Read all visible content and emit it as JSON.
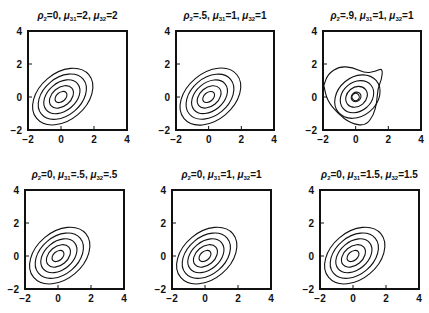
{
  "chart_data": [
    {
      "type": "contour",
      "panel": 1,
      "title": "ρ2=0, μ31=2, μ32=2",
      "params": {
        "rho2": "0",
        "mu31": "2",
        "mu32": "2"
      },
      "xlim": [
        -2,
        4
      ],
      "ylim": [
        -2,
        4
      ],
      "xticks": [
        "-2",
        "0",
        "2",
        "4"
      ],
      "yticks": [
        "-2",
        "0",
        "2",
        "4"
      ],
      "contour_levels": 5,
      "center": [
        0,
        0
      ],
      "orientation": "negative correlation (tilted top-left to bottom-right)",
      "frame": {
        "x": 28,
        "y": 31,
        "w": 99,
        "h": 99
      }
    },
    {
      "type": "contour",
      "panel": 2,
      "title": "ρ2=.5, μ31=1, μ32=1",
      "params": {
        "rho2": ".5",
        "mu31": "1",
        "mu32": "1"
      },
      "xlim": [
        -2,
        4
      ],
      "ylim": [
        -2,
        4
      ],
      "xticks": [
        "-2",
        "0",
        "2",
        "4"
      ],
      "yticks": [
        "-2",
        "0",
        "2",
        "4"
      ],
      "contour_levels": 5,
      "center": [
        0,
        0
      ],
      "orientation": "negative correlation, slightly squared outer contour",
      "frame": {
        "x": 176,
        "y": 31,
        "w": 98,
        "h": 99
      }
    },
    {
      "type": "contour",
      "panel": 3,
      "title": "ρ2=.9, μ31=1, μ32=1",
      "params": {
        "rho2": ".9",
        "mu31": "1",
        "mu32": "1"
      },
      "xlim": [
        -2,
        4
      ],
      "ylim": [
        -2,
        4
      ],
      "xticks": [
        "-2",
        "0",
        "2",
        "4"
      ],
      "yticks": [
        "-2",
        "0",
        "2",
        "4"
      ],
      "contour_levels": 6,
      "center": [
        0,
        0
      ],
      "orientation": "negative correlation, outer contour with a protrusion toward (1.7, 1.6)",
      "frame": {
        "x": 323,
        "y": 31,
        "w": 98,
        "h": 99
      }
    },
    {
      "type": "contour",
      "panel": 4,
      "title": "ρ2=0, μ31=.5, μ32=.5",
      "params": {
        "rho2": "0",
        "mu31": ".5",
        "mu32": ".5"
      },
      "xlim": [
        -2,
        4
      ],
      "ylim": [
        -2,
        4
      ],
      "xticks": [
        "-2",
        "0",
        "2",
        "4"
      ],
      "yticks": [
        "-2",
        "0",
        "2",
        "4"
      ],
      "contour_levels": 5,
      "center": [
        0,
        0
      ],
      "orientation": "negative correlation",
      "frame": {
        "x": 25,
        "y": 190,
        "w": 99,
        "h": 99
      }
    },
    {
      "type": "contour",
      "panel": 5,
      "title": "ρ2=0, μ31=1, μ32=1",
      "params": {
        "rho2": "0",
        "mu31": "1",
        "mu32": "1"
      },
      "xlim": [
        -2,
        4
      ],
      "ylim": [
        -2,
        4
      ],
      "xticks": [
        "-2",
        "0",
        "2",
        "4"
      ],
      "yticks": [
        "-2",
        "0",
        "2",
        "4"
      ],
      "contour_levels": 5,
      "center": [
        0,
        0
      ],
      "orientation": "negative correlation",
      "frame": {
        "x": 172,
        "y": 190,
        "w": 99,
        "h": 99
      }
    },
    {
      "type": "contour",
      "panel": 6,
      "title": "ρ2=0, μ31=1.5, μ32=1.5",
      "params": {
        "rho2": "0",
        "mu31": "1.5",
        "mu32": "1.5"
      },
      "xlim": [
        -2,
        4
      ],
      "ylim": [
        -2,
        4
      ],
      "xticks": [
        "-2",
        "0",
        "2",
        "4"
      ],
      "yticks": [
        "-2",
        "0",
        "2",
        "4"
      ],
      "contour_levels": 5,
      "center": [
        0,
        0
      ],
      "orientation": "negative correlation",
      "frame": {
        "x": 320,
        "y": 190,
        "w": 99,
        "h": 99
      }
    }
  ],
  "panels": [
    {
      "rho_val": "0",
      "mu31_val": "2",
      "mu32_val": "2"
    },
    {
      "rho_val": ".5",
      "mu31_val": "1",
      "mu32_val": "1"
    },
    {
      "rho_val": ".9",
      "mu31_val": "1",
      "mu32_val": "1"
    },
    {
      "rho_val": "0",
      "mu31_val": ".5",
      "mu32_val": ".5"
    },
    {
      "rho_val": "0",
      "mu31_val": "1",
      "mu32_val": "1"
    },
    {
      "rho_val": "0",
      "mu31_val": "1.5",
      "mu32_val": "1.5"
    }
  ],
  "symbols": {
    "rho": "ρ",
    "mu": "μ",
    "rho_sub": "2",
    "mu31_sub": "31",
    "mu32_sub": "32"
  },
  "ticks": {
    "t0": "−2",
    "t1": "0",
    "t2": "2",
    "t3": "4"
  }
}
